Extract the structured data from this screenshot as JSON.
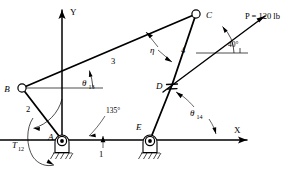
{
  "figure": {
    "background_color": "#ffffff",
    "line_color": "#000000"
  },
  "axes": {
    "x_label": "X",
    "y_label": "Y",
    "origin_label": "A"
  },
  "joints": [
    {
      "id": "B",
      "label": "B",
      "x": 22,
      "y": 88,
      "type": "pin"
    },
    {
      "id": "C",
      "label": "C",
      "x": 196,
      "y": 14,
      "type": "pin"
    },
    {
      "id": "D",
      "label": "D",
      "x": 172,
      "y": 85,
      "type": "pin-slider"
    },
    {
      "id": "A",
      "label": "A",
      "x": 62,
      "y": 140,
      "type": "ground-pivot"
    },
    {
      "id": "E",
      "label": "E",
      "x": 150,
      "y": 140,
      "type": "ground-pivot"
    }
  ],
  "links": [
    {
      "id": "1",
      "label": "1",
      "description": "ground link A-E"
    },
    {
      "id": "2",
      "label": "2",
      "description": "crank A-B"
    },
    {
      "id": "3",
      "label": "3",
      "description": "coupler B-C"
    },
    {
      "id": "4",
      "label": "4",
      "description": "link C-D-E"
    }
  ],
  "angles": [
    {
      "id": "theta13",
      "symbol": "θ",
      "subscript": "13",
      "description": "angle of link 3 from horizontal at B"
    },
    {
      "id": "theta14",
      "symbol": "θ",
      "subscript": "14",
      "description": "angle of link 4 from X axis"
    },
    {
      "id": "eta",
      "symbol": "η",
      "subscript": "",
      "description": "transmission angle between links 3 and 4"
    },
    {
      "id": "a135",
      "value": "135°",
      "description": "angle from Y axis to link 2 at A"
    },
    {
      "id": "a40",
      "value": "40°",
      "description": "angle of applied force P from horizontal"
    }
  ],
  "force": {
    "label": "P = 120 lb",
    "magnitude": "120",
    "unit": "lb",
    "angle": "40°"
  },
  "torque": {
    "symbol": "T",
    "subscript": "12",
    "label": "T12",
    "description": "input torque on link 2 at A"
  }
}
